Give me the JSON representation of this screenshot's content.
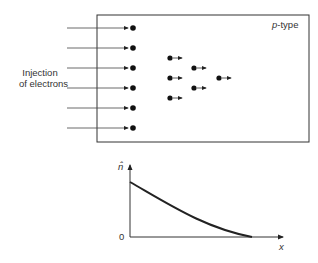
{
  "diagram": {
    "region_label": "p-type",
    "region_label_italic_part": "p",
    "region_label_rest": "-type",
    "injection_label_line1": "Injection",
    "injection_label_line2": "of electrons",
    "injected_electrons": 6,
    "diffusing_electrons": 6,
    "plot": {
      "y_axis_label": "n̂",
      "x_axis_label": "x",
      "origin_label": "0",
      "curve": "decaying profile from maximum at x=0 to zero"
    }
  }
}
